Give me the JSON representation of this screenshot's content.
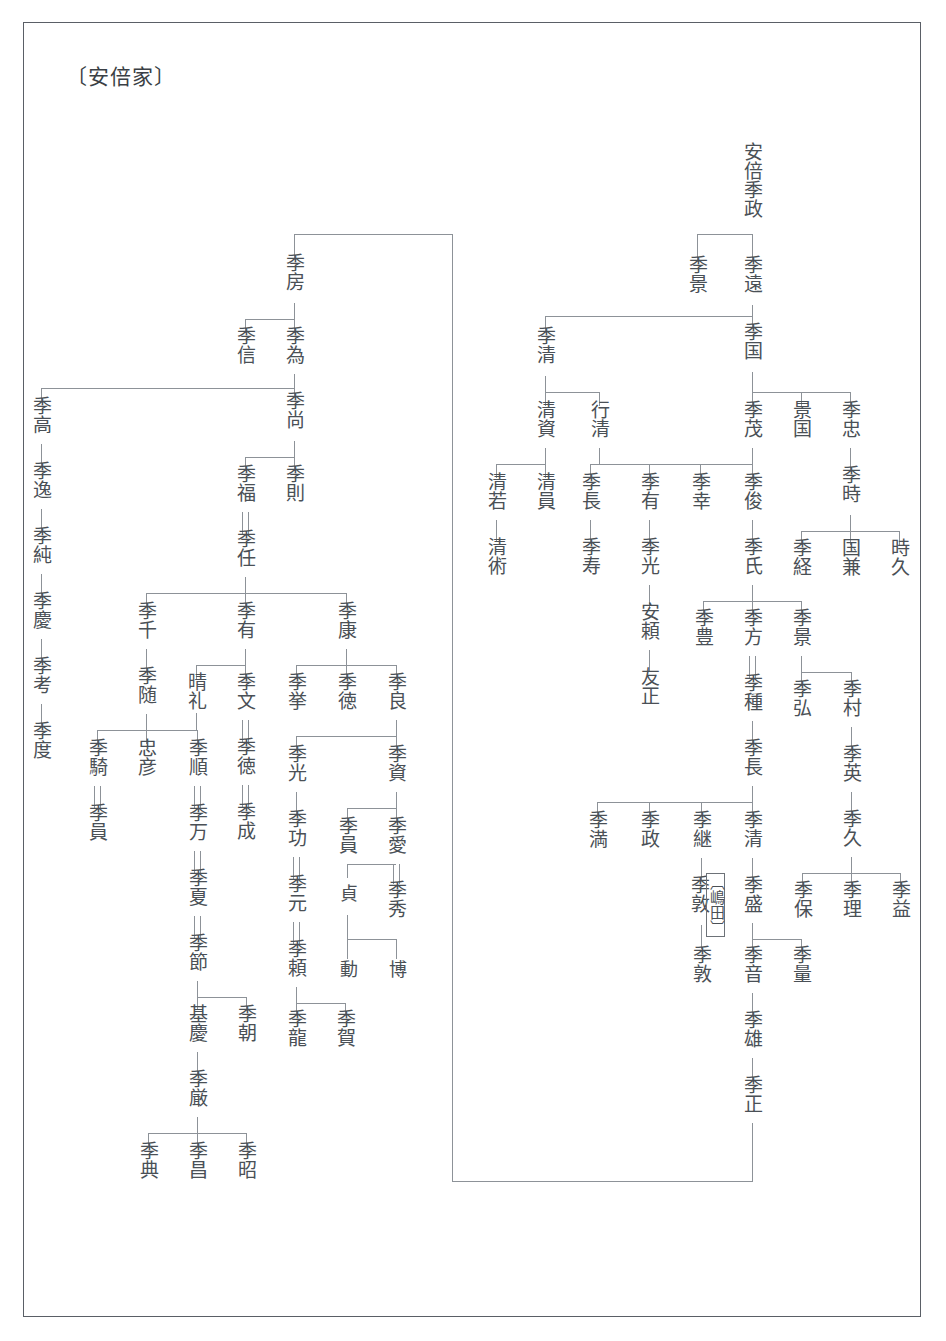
{
  "title": "〔安倍家〕",
  "chart_meta": {
    "type": "genealogy-tree",
    "orientation": "vertical-japanese",
    "line_color": "#8d9298",
    "text_color": "#4a5056",
    "frame_color": "#5a5f66"
  },
  "annotations": {
    "shimada": "〔嶋田〕"
  },
  "people": {
    "root": "安倍季政",
    "sue_kage": "季景",
    "sue_to": "季遠",
    "sue_kuni": "季国",
    "sue_shige": "季茂",
    "kage_kuni": "景国",
    "sue_tada": "季忠",
    "sue_toki": "季時",
    "sue_tsune": "季経",
    "kuni_kane": "国兼",
    "toki_hisa": "時久",
    "sue_ari": "季有",
    "sue_saci": "季幸",
    "sue_toshi": "季俊",
    "sue_uji": "季氏",
    "sue_mitsu": "季光",
    "yasu_yori": "安頼",
    "tomo_masa": "友正",
    "sue_yutaka": "季豊",
    "sue_kata": "季方",
    "sue_tane": "季種",
    "sue_kage2": "季景",
    "sue_hiro": "季弘",
    "sue_mura": "季村",
    "sue_hide": "季英",
    "sue_hisa": "季久",
    "sue_yasu": "季保",
    "sue_michi": "季理",
    "sue_masu": "季益",
    "sue_naga": "季長",
    "sue_mitsuru": "季満",
    "sue_masa": "季政",
    "sue_tsugu": "季継",
    "sue_kiyo": "季清",
    "sue_atsu": "季敦",
    "sue_mori": "季盛",
    "sue_atsu2": "季敦",
    "sue_oto": "季音",
    "sue_kazu": "季量",
    "sue_o": "季雄",
    "sue_tada2": "季正",
    "sue_kiyo_left": "季清",
    "kiyo_suke": "清資",
    "yuki_kiyo": "行清",
    "kiyo_waka": "清若",
    "kiyo_kazu": "清員",
    "kiyo_jutsu": "清術",
    "sue_naga2": "季長",
    "sue_hisa2": "季寿",
    "sue_fusa": "季房",
    "sue_nobu": "季信",
    "sue_tame": "季為",
    "sue_hisa3": "季尚",
    "sue_fuku": "季福",
    "sue_nori": "季則",
    "sue_tou": "季任",
    "sue_taka": "季高",
    "sue_itsu": "季逸",
    "sue_jun": "季純",
    "sue_kei": "季慶",
    "sue_kou": "季考",
    "sue_do": "季度",
    "sue_sen": "季千",
    "sue_ari2": "季有",
    "sue_yasu2": "季康",
    "sue_zui": "季随",
    "sue_ki": "季騎",
    "sue_kazu2": "季員",
    "tada_hiko": "忠彦",
    "sue_jun2": "季順",
    "sue_man": "季万",
    "sue_natsu": "季夏",
    "sue_setsu": "季節",
    "moto_yoshi": "基慶",
    "sue_tomo": "季朝",
    "sue_gon": "季厳",
    "sue_nori2": "季典",
    "sue_masa2": "季昌",
    "sue_aki": "季昭",
    "hare_rei": "晴礼",
    "sue_fumi": "季文",
    "sue_toku": "季徳",
    "sue_nari": "季成",
    "sue_kyo": "季挙",
    "sue_toku2": "季徳",
    "sue_yoshi": "季良",
    "sue_mitsu2": "季光",
    "sue_kou2": "季功",
    "sue_gen": "季元",
    "sue_yori": "季頼",
    "sue_ryu": "季龍",
    "sue_ga": "季賀",
    "sue_suke": "季資",
    "sue_kazu3": "季員",
    "sue_ai": "季愛",
    "sue_shu": "季秀",
    "tei": "貞",
    "dou": "動",
    "haku": "博"
  }
}
